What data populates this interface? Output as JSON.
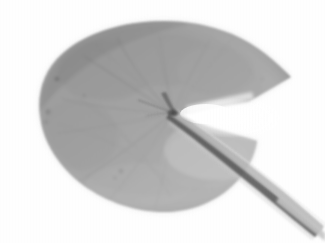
{
  "image": {
    "subject": "water-lily-pad-leaf",
    "caption": "Grayscale scan of a water lily pad leaf",
    "medium": "flatbed-scan",
    "color_mode": "grayscale",
    "width_px": 325,
    "height_px": 243
  },
  "colors": {
    "background": "#ffffff",
    "leaf_base": "#a3a3a3",
    "leaf_light": "#b9b9b9",
    "leaf_mid": "#9b9b9b",
    "leaf_dark": "#8a8a8a",
    "leaf_edge_shadow": "#7e7e7e",
    "vein": "#6e6e6e",
    "vein_faint": "#8c8c8c",
    "petiole_dark": "#4a4a4a",
    "petiole_mid": "#7a7a7a",
    "petiole_light": "#c4c4c4",
    "sinus_highlight": "#ffffff",
    "blemish": "#5a5a5a",
    "halo": "#ededed",
    "scanline": "#959595"
  },
  "geometry": {
    "leaf_center_x": 160,
    "leaf_center_y": 115,
    "leaf_left_x": 39,
    "leaf_right_tip_x": 291,
    "leaf_top_y": 21,
    "leaf_bottom_y": 213,
    "petiole_node_x": 173,
    "petiole_node_y": 113,
    "petiole_exit_x": 320,
    "petiole_exit_y": 231
  },
  "parts": {
    "lamina": "leaf-blade",
    "sinus": "sinus-notch",
    "petiole": "petiole-stem",
    "node": "petiole-attachment-node",
    "veins": "radiating-veins",
    "texture": "vertical-scanline-texture"
  },
  "veins": [
    {
      "name": "vein-upper-left-1",
      "d": "M173,113 C150,100 118,78 84,56"
    },
    {
      "name": "vein-upper-left-2",
      "d": "M173,113 C152,94 132,66 117,38"
    },
    {
      "name": "vein-up-1",
      "d": "M173,113 C168,88 163,62 159,34"
    },
    {
      "name": "vein-up-right-1",
      "d": "M173,113 C183,90 196,64 210,40"
    },
    {
      "name": "vein-left-1",
      "d": "M173,113 C141,112 102,108 62,99"
    },
    {
      "name": "vein-left-2",
      "d": "M173,113 C140,120 100,128 58,133"
    },
    {
      "name": "vein-lower-left-1",
      "d": "M173,113 C147,134 114,160 79,182"
    },
    {
      "name": "vein-lower-left-2",
      "d": "M173,113 C155,142 131,175 108,201"
    },
    {
      "name": "vein-lower-1",
      "d": "M173,113 C170,146 164,180 155,207"
    },
    {
      "name": "vein-arc-1",
      "d": "M70,92 C108,118 146,150 170,196"
    },
    {
      "name": "vein-arc-2",
      "d": "M58,124 C100,134 141,155 172,186"
    },
    {
      "name": "vein-arc-3",
      "d": "M96,46 C126,70 152,92 171,112"
    }
  ],
  "blemishes": [
    {
      "name": "blemish-left-upper",
      "cx": 57,
      "cy": 79,
      "r": 2.0
    },
    {
      "name": "blemish-left-mid",
      "cx": 48,
      "cy": 112,
      "r": 2.4
    },
    {
      "name": "blemish-left-low",
      "cx": 46,
      "cy": 122,
      "r": 1.6
    },
    {
      "name": "blemish-center-upper",
      "cx": 84,
      "cy": 96,
      "r": 1.4
    },
    {
      "name": "blemish-center",
      "cx": 121,
      "cy": 171,
      "r": 1.6
    },
    {
      "name": "blemish-center-low",
      "cx": 115,
      "cy": 178,
      "r": 1.2
    },
    {
      "name": "blemish-right-upper",
      "cx": 262,
      "cy": 79,
      "r": 1.3
    }
  ]
}
